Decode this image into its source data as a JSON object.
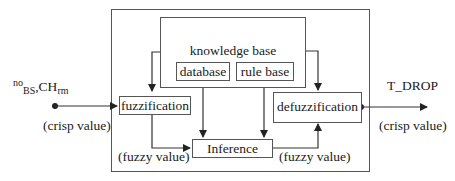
{
  "diagram": {
    "input": {
      "variables": {
        "v1_sup": "no",
        "v1_sub": "BS",
        "sep": ",",
        "v2": "CH",
        "v2_sub": "rm"
      },
      "annotation": "(crisp value)"
    },
    "output": {
      "variable": "T_DROP",
      "annotation": "(crisp value)"
    },
    "knowledge_base": {
      "label": "knowledge base",
      "children": [
        {
          "label": "database"
        },
        {
          "label": "rule base"
        }
      ]
    },
    "blocks": {
      "fuzzification": "fuzzification",
      "inference": "Inference",
      "defuzzification": "defuzzification"
    },
    "edge_labels": {
      "fuzz_to_inference": "(fuzzy value)",
      "inference_to_defuzz": "(fuzzy value)"
    },
    "edges": [
      {
        "from": "input",
        "to": "fuzzification"
      },
      {
        "from": "knowledge base",
        "to": "fuzzification"
      },
      {
        "from": "knowledge base",
        "to": "defuzzification"
      },
      {
        "from": "database",
        "to": "Inference"
      },
      {
        "from": "rule base",
        "to": "Inference"
      },
      {
        "from": "fuzzification",
        "to": "Inference"
      },
      {
        "from": "Inference",
        "to": "defuzzification"
      },
      {
        "from": "defuzzification",
        "to": "output"
      }
    ],
    "colors": {
      "line": "#333333",
      "box_border": "#555555",
      "text": "#1a1a1a"
    }
  }
}
